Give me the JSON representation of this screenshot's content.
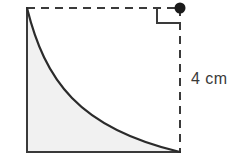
{
  "figure": {
    "background_color": "#ffffff"
  },
  "labels": {
    "side_length": "4 cm"
  },
  "geometry": {
    "square": {
      "left_x": 27,
      "right_x": 180,
      "top_y": 8,
      "bottom_y": 152,
      "solid_sides": [
        "left",
        "bottom"
      ],
      "dashed_sides": [
        "top",
        "right"
      ]
    },
    "curve": {
      "type": "exponential-decay",
      "start": [
        27,
        8
      ],
      "end": [
        180,
        152
      ],
      "stroke_color": "#2b2b2b",
      "stroke_width": 2
    },
    "shaded_region": {
      "fill_color": "#f1f1f1",
      "description": "area bounded by left side, bottom side, and the curve"
    },
    "right_angle_marker": {
      "x": 157,
      "y": 8,
      "size": 23,
      "stroke_color": "#3a3a3a"
    },
    "vertex_dot": {
      "cx": 180,
      "cy": 8,
      "r": 5.5,
      "fill_color": "#1a1a1a"
    }
  },
  "colors": {
    "line": "#3a3a3a",
    "curve": "#2b2b2b",
    "shading": "#f1f1f1",
    "dot": "#1a1a1a",
    "text": "#3a3a3a"
  }
}
